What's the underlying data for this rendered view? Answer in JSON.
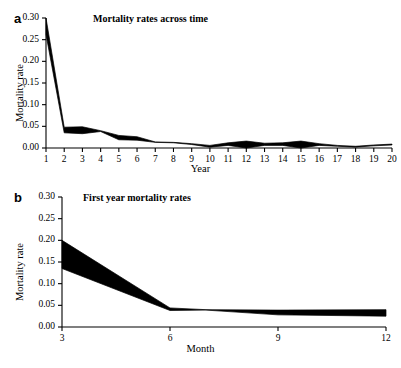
{
  "figure": {
    "panels": [
      {
        "letter": "a",
        "title": "Mortality rates across time",
        "xlabel": "Year",
        "ylabel": "Mortality rate"
      },
      {
        "letter": "b",
        "title": "First year mortality rates",
        "xlabel": "Month",
        "ylabel": "Mortality rate"
      }
    ]
  },
  "chart_data": [
    {
      "type": "area",
      "panel": "a",
      "title": "Mortality rates across time",
      "xlabel": "Year",
      "ylabel": "Mortality rate",
      "xlim": [
        1,
        20
      ],
      "ylim": [
        0.0,
        0.3
      ],
      "grid": false,
      "legend": null,
      "yticks": [
        "0.00",
        "0.05",
        "0.10",
        "0.15",
        "0.20",
        "0.25",
        "0.30"
      ],
      "ytick_values": [
        0.0,
        0.05,
        0.1,
        0.15,
        0.2,
        0.25,
        0.3
      ],
      "xticks": [
        "1",
        "2",
        "3",
        "4",
        "5",
        "6",
        "7",
        "8",
        "9",
        "10",
        "11",
        "12",
        "13",
        "14",
        "15",
        "16",
        "17",
        "18",
        "19",
        "20"
      ],
      "xtick_values": [
        1,
        2,
        3,
        4,
        5,
        6,
        7,
        8,
        9,
        10,
        11,
        12,
        13,
        14,
        15,
        16,
        17,
        18,
        19,
        20
      ],
      "x": [
        1,
        2,
        3,
        4,
        5,
        6,
        7,
        8,
        9,
        10,
        11,
        12,
        13,
        14,
        15,
        16,
        17,
        18,
        19,
        20
      ],
      "series": [
        {
          "name": "upper confidence bound",
          "values": [
            0.3,
            0.048,
            0.049,
            0.04,
            0.029,
            0.026,
            0.014,
            0.013,
            0.01,
            0.006,
            0.012,
            0.016,
            0.011,
            0.012,
            0.016,
            0.01,
            0.006,
            0.004,
            0.007,
            0.009
          ]
        },
        {
          "name": "lower confidence bound",
          "values": [
            0.262,
            0.035,
            0.033,
            0.038,
            0.019,
            0.018,
            0.013,
            0.012,
            0.008,
            0.002,
            0.006,
            0.0,
            0.006,
            0.006,
            0.0,
            0.006,
            0.004,
            0.002,
            0.005,
            0.007
          ]
        }
      ],
      "band_fill": "#000000"
    },
    {
      "type": "area",
      "panel": "b",
      "title": "First year mortality rates",
      "xlabel": "Month",
      "ylabel": "Mortality rate",
      "xlim": [
        3,
        12
      ],
      "ylim": [
        0.0,
        0.3
      ],
      "grid": false,
      "legend": null,
      "yticks": [
        "0.00",
        "0.05",
        "0.10",
        "0.15",
        "0.20",
        "0.25",
        "0.30"
      ],
      "ytick_values": [
        0.0,
        0.05,
        0.1,
        0.15,
        0.2,
        0.25,
        0.3
      ],
      "xticks": [
        "3",
        "6",
        "9",
        "12"
      ],
      "xtick_values": [
        3,
        6,
        9,
        12
      ],
      "x": [
        3,
        6,
        7,
        9,
        12
      ],
      "series": [
        {
          "name": "upper confidence bound",
          "values": [
            0.2,
            0.044,
            0.04,
            0.039,
            0.04
          ]
        },
        {
          "name": "lower confidence bound",
          "values": [
            0.135,
            0.038,
            0.039,
            0.028,
            0.025
          ]
        }
      ],
      "band_fill": "#000000"
    }
  ]
}
